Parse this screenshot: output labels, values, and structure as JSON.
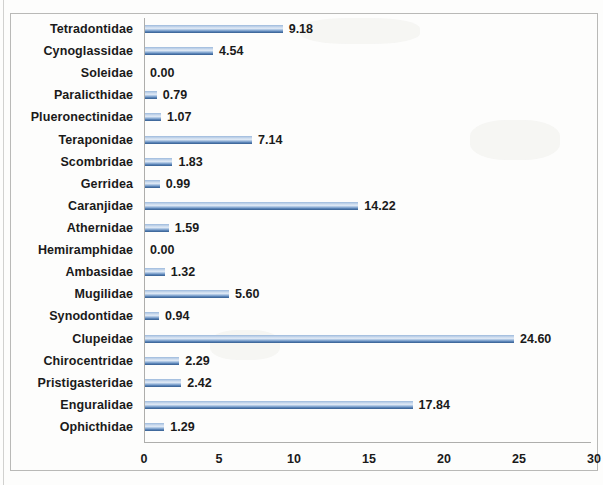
{
  "chart_data": {
    "type": "bar",
    "orientation": "horizontal",
    "title": "",
    "xlabel": "",
    "ylabel": "",
    "xlim": [
      0,
      30
    ],
    "xticks": [
      0,
      5,
      10,
      15,
      20,
      25,
      30
    ],
    "grid": false,
    "legend": false,
    "bar_color": "#4f81bd",
    "categories": [
      "Tetradontidae",
      "Cynoglassidae",
      "Soleidae",
      "Paralicthidae",
      "Plueronectinidae",
      "Teraponidae",
      "Scombridae",
      "Gerridea",
      "Caranjidae",
      "Athernidae",
      "Hemiramphidae",
      "Ambasidae",
      "Mugilidae",
      "Synodontidae",
      "Clupeidae",
      "Chirocentridae",
      "Pristigasteridae",
      "Enguralidae",
      "Ophicthidae"
    ],
    "values": [
      9.18,
      4.54,
      0.0,
      0.79,
      1.07,
      7.14,
      1.83,
      0.99,
      14.22,
      1.59,
      0.0,
      1.32,
      5.6,
      0.94,
      24.6,
      2.29,
      2.42,
      17.84,
      1.29
    ],
    "value_labels": [
      "9.18",
      "4.54",
      "0.00",
      "0.79",
      "1.07",
      "7.14",
      "1.83",
      "0.99",
      "14.22",
      "1.59",
      "0.00",
      "1.32",
      "5.60",
      "0.94",
      "24.60",
      "2.29",
      "2.42",
      "17.84",
      "1.29"
    ],
    "xtick_labels": [
      "0",
      "5",
      "10",
      "15",
      "20",
      "25",
      "30"
    ]
  }
}
